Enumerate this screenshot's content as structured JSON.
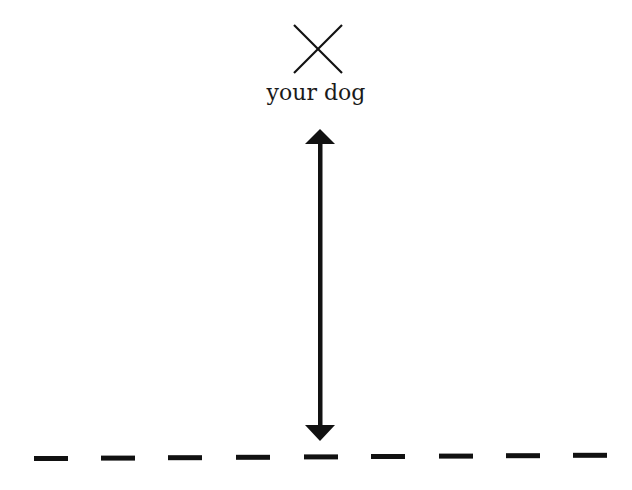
{
  "diagram": {
    "marker": {
      "icon": "x-mark-icon",
      "label": "your dog",
      "center": [
        318,
        49
      ],
      "size": 48
    },
    "arrow": {
      "type": "double-headed-vertical",
      "x": 320,
      "y_top": 129,
      "y_bottom": 441
    },
    "baseline": {
      "style": "dashed",
      "dash_count": 9,
      "dash_starts": [
        34,
        101,
        168,
        236,
        304,
        371,
        439,
        506,
        573
      ],
      "dash_width": 34,
      "y": 457
    },
    "colors": {
      "stroke": "#111111",
      "background": "#ffffff"
    }
  }
}
